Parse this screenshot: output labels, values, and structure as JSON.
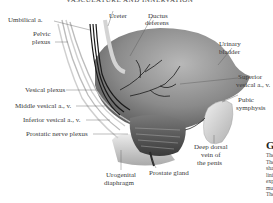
{
  "header": {
    "title": "VASCULATURE AND INNERVATION"
  },
  "labels": {
    "umbilical_a": "Umbilical a.",
    "pelvic_plexus_1": "Pelvic",
    "pelvic_plexus_2": "plexus",
    "ureter": "Ureter",
    "ductus_deferens_1": "Ductus",
    "ductus_deferens_2": "deferens",
    "urinary_bladder_1": "Urinary",
    "urinary_bladder_2": "bladder",
    "superior_vesical_1": "Superior",
    "superior_vesical_2": "vesical a., v.",
    "pubic_symphysis_1": "Pubic",
    "pubic_symphysis_2": "symphysis",
    "vesical_plexus": "Vesical plexus",
    "middle_vesical": "Middle vesical a., v.",
    "inferior_vesical": "Inferior vesical a., v.",
    "prostatic_nerve_plexus": "Prostatic nerve plexus",
    "deep_dorsal_vein_1": "Deep dorsal",
    "deep_dorsal_vein_2": "vein of",
    "deep_dorsal_vein_3": "the penis",
    "urogenital_diaphragm_1": "Urogenital",
    "urogenital_diaphragm_2": "diaphragm",
    "prostate_gland": "Prostate gland"
  },
  "side_column": {
    "heading": "Gl",
    "lines": [
      "The",
      "The",
      "sha",
      "lini",
      "exp",
      "mu",
      "The"
    ]
  },
  "colors": {
    "bladder": "#8a8a8a",
    "bladder_highlight": "#c8c8c8",
    "vessel_dark": "#1a1a1a",
    "nerve": "#d8d8d8",
    "leader": "#555555",
    "text": "#3a3a3a"
  }
}
